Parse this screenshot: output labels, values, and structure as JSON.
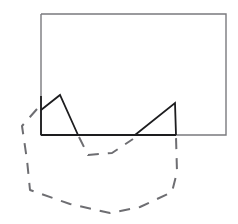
{
  "figure": {
    "canvas": {
      "width": 238,
      "height": 224,
      "background": "#ffffff"
    },
    "colors": {
      "solid_dark": "#1d1d1f",
      "solid_gray": "#7a7a7e",
      "dashed": "#6e6e72"
    },
    "shapes": {
      "rectangle": {
        "name": "rectangle",
        "stroke": "#7a7a7e",
        "stroke_width": 1.4,
        "points": "41,14 226,14 226,135 41,135 41,14"
      },
      "baseline_dark": {
        "name": "baseline-dark-segment",
        "stroke": "#1d1d1f",
        "stroke_width": 2.1,
        "points": "41,135 176,135"
      },
      "left_edge_dark": {
        "name": "rectangle-left-edge-dark",
        "stroke": "#1d1d1f",
        "stroke_width": 1.8,
        "points": "41,96 41,135"
      },
      "triangle_left": {
        "name": "triangle-left",
        "stroke": "#1d1d1f",
        "stroke_width": 1.8,
        "points": "41,110 60,95 78,135"
      },
      "triangle_right": {
        "name": "triangle-right",
        "stroke": "#1d1d1f",
        "stroke_width": 1.8,
        "points": "135,135 175,103 176,135"
      },
      "dashed_outline": {
        "name": "dashed-outline-curve",
        "stroke": "#6e6e72",
        "stroke_width": 2.0,
        "dash_pattern": "11 9",
        "points": "37,109 22,126 27,160 30,190 70,204 110,213 140,207 172,192 177,172 176,137"
      },
      "dashed_inner_v": {
        "name": "dashed-inner-v",
        "stroke": "#6e6e72",
        "stroke_width": 2.0,
        "dash_pattern": "11 9",
        "points": "79,137 88,155 112,153 133,139"
      }
    }
  }
}
